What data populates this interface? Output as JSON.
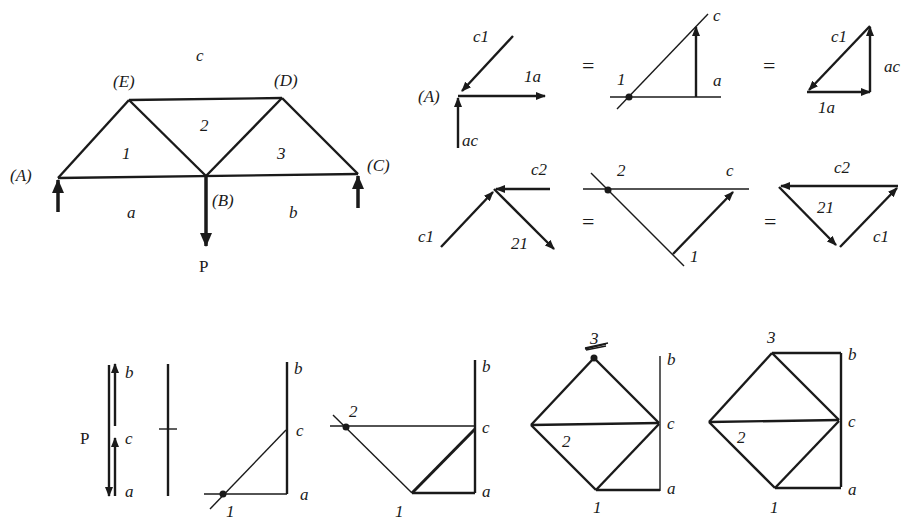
{
  "truss": {
    "joints": {
      "A": "(A)",
      "B": "(B)",
      "C": "(C)",
      "D": "(D)",
      "E": "(E)"
    },
    "regions": {
      "top": "c",
      "left_bottom": "a",
      "right_bottom": "b",
      "r1": "1",
      "r2": "2",
      "r3": "3"
    },
    "load_label": "P"
  },
  "joint_A": {
    "free_body": {
      "joint": "(A)",
      "f1": "c1",
      "f2": "1a",
      "f3": "ac"
    },
    "eq1": "=",
    "construction": {
      "p1": "1",
      "pc": "c",
      "pa": "a"
    },
    "eq2": "=",
    "triangle": {
      "f1": "c1",
      "f2": "ac",
      "f3": "1a"
    }
  },
  "joint_E": {
    "free_body": {
      "f1": "c2",
      "f2": "c1",
      "f3": "21"
    },
    "eq1": "=",
    "construction": {
      "p2": "2",
      "pc": "c",
      "p1": "1"
    },
    "eq2": "=",
    "triangle": {
      "f1": "c2",
      "f2": "21",
      "f3": "c1"
    }
  },
  "force_polygon": {
    "step0": {
      "load": "P",
      "b": "b",
      "c": "c",
      "a": "a"
    },
    "step2": {
      "b": "b",
      "c": "c",
      "a": "a",
      "p1": "1"
    },
    "step3": {
      "b": "b",
      "c": "c",
      "a": "a",
      "p1": "1",
      "p2": "2"
    },
    "step4": {
      "b": "b",
      "c": "c",
      "a": "a",
      "p1": "1",
      "p2": "2",
      "p3": "3"
    },
    "step5": {
      "b": "b",
      "c": "c",
      "a": "a",
      "p1": "1",
      "p2": "2",
      "p3": "3"
    }
  }
}
